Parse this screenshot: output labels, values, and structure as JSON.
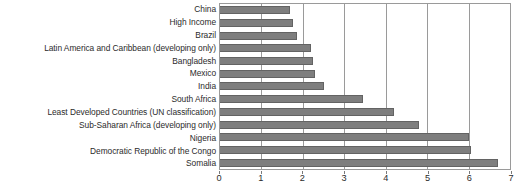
{
  "chart_data": {
    "type": "bar",
    "orientation": "horizontal",
    "title": "",
    "subtitle": "",
    "xlabel": "",
    "ylabel": "",
    "xlim": [
      0,
      7
    ],
    "grid": true,
    "legend": false,
    "xticks": [
      "0",
      "1",
      "2",
      "3",
      "4",
      "5",
      "6",
      "7"
    ],
    "xtick_values": [
      0,
      1,
      2,
      3,
      4,
      5,
      6,
      7
    ],
    "categories": [
      "China",
      "High Income",
      "Brazil",
      "Latin America and Caribbean (developing only)",
      "Bangladesh",
      "Mexico",
      "India",
      "South Africa",
      "Least Developed Countries (UN classification)",
      "Sub-Saharan Africa (developing only)",
      "Nigeria",
      "Democratic Republic of the Congo",
      "Somalia"
    ],
    "values": [
      1.7,
      1.75,
      1.85,
      2.2,
      2.25,
      2.3,
      2.5,
      3.45,
      4.2,
      4.8,
      6.0,
      6.05,
      6.7
    ],
    "bar_color": "#7e7e7e",
    "bar_edge_color": "#636363",
    "frame_color": "#9a9a9a",
    "background_color": "#ffffff",
    "text_color": "#2b2b2b"
  }
}
